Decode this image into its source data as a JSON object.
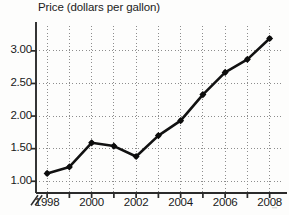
{
  "chart_data": {
    "type": "line",
    "title": "Price (dollars per gallon)",
    "xlabel": "",
    "ylabel": "Price (dollars per gallon)",
    "x": [
      1998,
      1999,
      2000,
      2001,
      2002,
      2003,
      2004,
      2005,
      2006,
      2007,
      2008
    ],
    "values": [
      1.12,
      1.22,
      1.59,
      1.54,
      1.38,
      1.7,
      1.93,
      2.33,
      2.67,
      2.87,
      3.19
    ],
    "series": [
      {
        "name": "Price",
        "values": [
          1.12,
          1.22,
          1.59,
          1.54,
          1.38,
          1.7,
          1.93,
          2.33,
          2.67,
          2.87,
          3.19
        ]
      }
    ],
    "xlim": [
      1997.5,
      2008.6
    ],
    "ylim": [
      0.82,
      3.32
    ],
    "ytick_values": [
      1.0,
      1.5,
      2.0,
      2.5,
      3.0
    ],
    "ytick_labels": [
      "1.00",
      "1.50",
      "2.00",
      "2.50",
      "3.00"
    ],
    "xtick_values": [
      1998,
      1999,
      2000,
      2001,
      2002,
      2003,
      2004,
      2005,
      2006,
      2007,
      2008
    ],
    "xtick_labels_shown": [
      "1998",
      "2000",
      "2002",
      "2004",
      "2006",
      "2008"
    ],
    "xtick_labeled_values": [
      1998,
      2000,
      2002,
      2004,
      2006,
      2008
    ],
    "grid": true,
    "grid_style": "dotted",
    "legend": false,
    "legend_position": "none",
    "y_axis_break": true,
    "annotations": [],
    "colors": {
      "line": "#111111",
      "marker": "#0d0d0d",
      "grid": "#8d8d8d",
      "axis": "#2b2b2b",
      "background": "#fdfdfc",
      "text": "#191919"
    }
  },
  "marks": {
    "axis_break_symbol": "axis-break-icon",
    "marker_shape": "diamond"
  },
  "artifacts": {
    "corner_smudge": "\"\""
  }
}
